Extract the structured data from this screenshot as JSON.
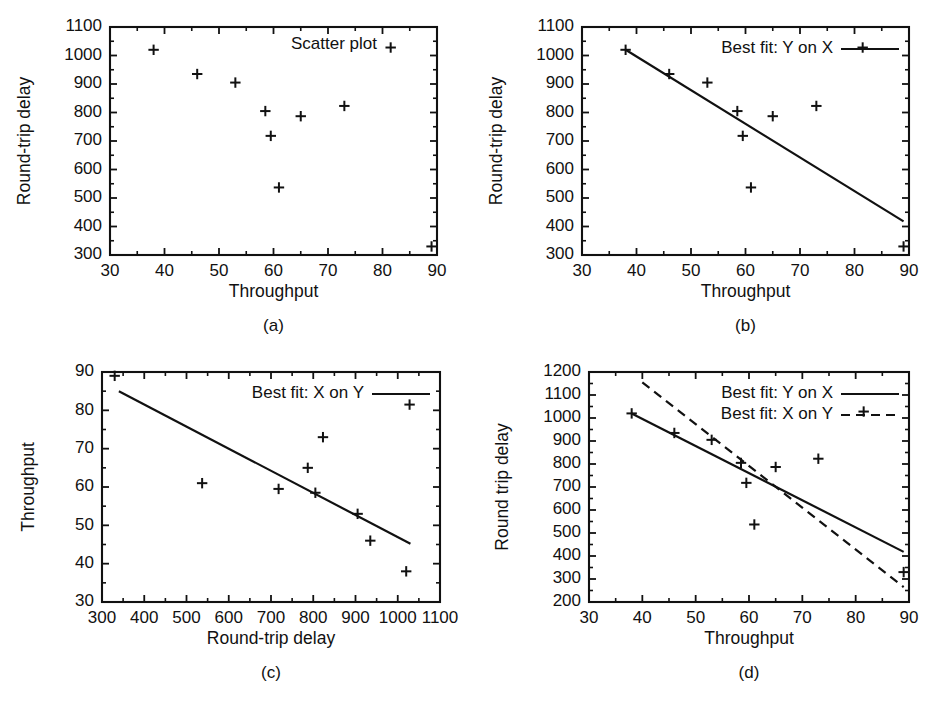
{
  "figure": {
    "marker_symbol": "plus-marker"
  },
  "chart_data": [
    {
      "type": "scatter",
      "panel": "a",
      "caption": "(a)",
      "title": "Scatter plot",
      "xlabel": "Throughput",
      "ylabel": "Round-trip delay",
      "xlim": [
        30,
        90
      ],
      "ylim": [
        300,
        1100
      ],
      "xticks": [
        30,
        40,
        50,
        60,
        70,
        80,
        90
      ],
      "yticks": [
        300,
        400,
        500,
        600,
        700,
        800,
        900,
        1000,
        1100
      ],
      "xtick_labels": [
        "30",
        "40",
        "50",
        "60",
        "70",
        "80",
        "90"
      ],
      "ytick_labels": [
        "300",
        "400",
        "500",
        "600",
        "700",
        "800",
        "900",
        "1000",
        "1100"
      ],
      "grid": false,
      "legend": null,
      "x": [
        38,
        46,
        53,
        58.5,
        59.5,
        61,
        65,
        73,
        81.5,
        89
      ],
      "y": [
        1020,
        935,
        905,
        805,
        718,
        537,
        787,
        823,
        1028,
        330
      ],
      "series": []
    },
    {
      "type": "scatter",
      "panel": "b",
      "caption": "(b)",
      "title": "",
      "xlabel": "Throughput",
      "ylabel": "Round-trip delay",
      "xlim": [
        30,
        90
      ],
      "ylim": [
        300,
        1100
      ],
      "xticks": [
        30,
        40,
        50,
        60,
        70,
        80,
        90
      ],
      "yticks": [
        300,
        400,
        500,
        600,
        700,
        800,
        900,
        1000,
        1100
      ],
      "xtick_labels": [
        "30",
        "40",
        "50",
        "60",
        "70",
        "80",
        "90"
      ],
      "ytick_labels": [
        "300",
        "400",
        "500",
        "600",
        "700",
        "800",
        "900",
        "1000",
        "1100"
      ],
      "grid": false,
      "legend": {
        "position": "top-right",
        "entries": [
          {
            "label": "Best fit: Y on X",
            "style": "solid"
          }
        ]
      },
      "x": [
        38,
        46,
        53,
        58.5,
        59.5,
        61,
        65,
        73,
        81.5,
        89
      ],
      "y": [
        1020,
        935,
        905,
        805,
        718,
        537,
        787,
        823,
        1028,
        330
      ],
      "series": [
        {
          "name": "Best fit: Y on X",
          "style": "solid",
          "x": [
            38,
            89
          ],
          "y": [
            1020,
            418
          ]
        }
      ]
    },
    {
      "type": "scatter",
      "panel": "c",
      "caption": "(c)",
      "title": "",
      "xlabel": "Round-trip delay",
      "ylabel": "Throughput",
      "xlim": [
        300,
        1100
      ],
      "ylim": [
        30,
        90
      ],
      "xticks": [
        300,
        400,
        500,
        600,
        700,
        800,
        900,
        1000,
        1100
      ],
      "yticks": [
        30,
        40,
        50,
        60,
        70,
        80,
        90
      ],
      "xtick_labels": [
        "300",
        "400",
        "500",
        "600",
        "700",
        "800",
        "900",
        "1000",
        "1100"
      ],
      "ytick_labels": [
        "30",
        "40",
        "50",
        "60",
        "70",
        "80",
        "90"
      ],
      "grid": false,
      "legend": {
        "position": "top-right",
        "entries": [
          {
            "label": "Best fit: X on Y",
            "style": "solid"
          }
        ]
      },
      "x": [
        1020,
        935,
        905,
        805,
        718,
        537,
        787,
        823,
        1028,
        330
      ],
      "y": [
        38,
        46,
        53,
        58.5,
        59.5,
        61,
        65,
        73,
        81.5,
        89
      ],
      "series": [
        {
          "name": "Best fit: X on Y",
          "style": "solid",
          "x": [
            340,
            1030
          ],
          "y": [
            85,
            45.2
          ]
        }
      ]
    },
    {
      "type": "scatter",
      "panel": "d",
      "caption": "(d)",
      "title": "",
      "xlabel": "Throughput",
      "ylabel": "Round trip delay",
      "xlim": [
        30,
        90
      ],
      "ylim": [
        200,
        1200
      ],
      "xticks": [
        30,
        40,
        50,
        60,
        70,
        80,
        90
      ],
      "yticks": [
        200,
        300,
        400,
        500,
        600,
        700,
        800,
        900,
        1000,
        1100,
        1200
      ],
      "xtick_labels": [
        "30",
        "40",
        "50",
        "60",
        "70",
        "80",
        "90"
      ],
      "ytick_labels": [
        "200",
        "300",
        "400",
        "500",
        "600",
        "700",
        "800",
        "900",
        "1000",
        "1100",
        "1200"
      ],
      "grid": false,
      "legend": {
        "position": "top-right",
        "entries": [
          {
            "label": "Best fit: Y on X",
            "style": "solid"
          },
          {
            "label": "Best fit: X on Y",
            "style": "dashed"
          }
        ]
      },
      "x": [
        38,
        46,
        53,
        58.5,
        59.5,
        61,
        65,
        73,
        81.5,
        89
      ],
      "y": [
        1020,
        935,
        905,
        805,
        718,
        537,
        787,
        823,
        1028,
        330
      ],
      "series": [
        {
          "name": "Best fit: Y on X",
          "style": "solid",
          "x": [
            38,
            89
          ],
          "y": [
            1020,
            418
          ]
        },
        {
          "name": "Best fit: X on Y",
          "style": "dashed",
          "x": [
            40,
            89
          ],
          "y": [
            1155,
            265
          ]
        }
      ]
    }
  ]
}
